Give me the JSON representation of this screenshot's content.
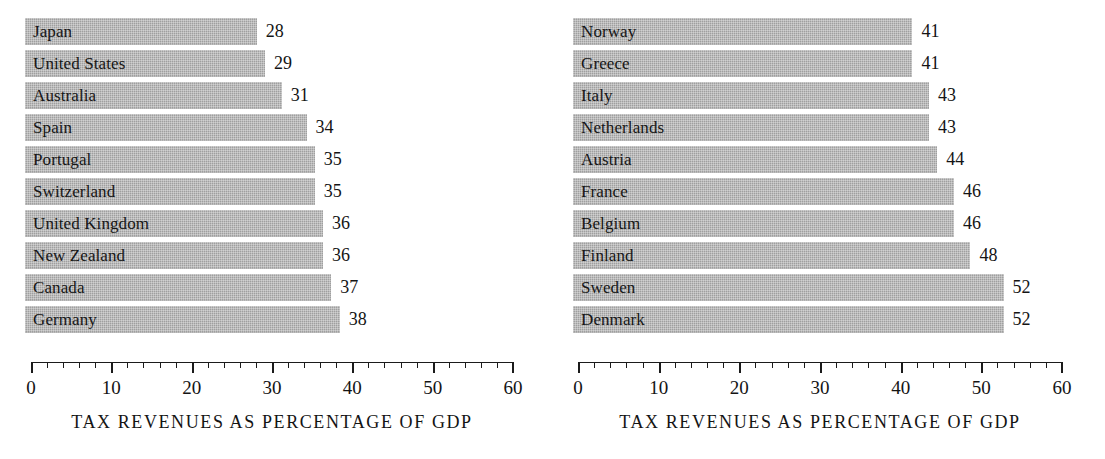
{
  "figure": {
    "background_color": "#ffffff",
    "bar_color": "#a9a9a9",
    "text_color": "#161616"
  },
  "axis": {
    "min": 0,
    "max": 60,
    "major_step": 10,
    "minor_step": 2,
    "tick_labels": [
      "0",
      "10",
      "20",
      "30",
      "40",
      "50",
      "60"
    ]
  },
  "charts": [
    {
      "id": "left",
      "caption": "TAX REVENUES AS PERCENTAGE OF GDP",
      "bars": [
        {
          "label": "Japan",
          "value": 28,
          "value_text": "28"
        },
        {
          "label": "United States",
          "value": 29,
          "value_text": "29"
        },
        {
          "label": "Australia",
          "value": 31,
          "value_text": "31"
        },
        {
          "label": "Spain",
          "value": 34,
          "value_text": "34"
        },
        {
          "label": "Portugal",
          "value": 35,
          "value_text": "35"
        },
        {
          "label": "Switzerland",
          "value": 35,
          "value_text": "35"
        },
        {
          "label": "United Kingdom",
          "value": 36,
          "value_text": "36"
        },
        {
          "label": "New Zealand",
          "value": 36,
          "value_text": "36"
        },
        {
          "label": "Canada",
          "value": 37,
          "value_text": "37"
        },
        {
          "label": "Germany",
          "value": 38,
          "value_text": "38"
        }
      ]
    },
    {
      "id": "right",
      "caption": "TAX REVENUES AS PERCENTAGE OF GDP",
      "bars": [
        {
          "label": "Norway",
          "value": 41,
          "value_text": "41"
        },
        {
          "label": "Greece",
          "value": 41,
          "value_text": "41"
        },
        {
          "label": "Italy",
          "value": 43,
          "value_text": "43"
        },
        {
          "label": "Netherlands",
          "value": 43,
          "value_text": "43"
        },
        {
          "label": "Austria",
          "value": 44,
          "value_text": "44"
        },
        {
          "label": "France",
          "value": 46,
          "value_text": "46"
        },
        {
          "label": "Belgium",
          "value": 46,
          "value_text": "46"
        },
        {
          "label": "Finland",
          "value": 48,
          "value_text": "48"
        },
        {
          "label": "Sweden",
          "value": 52,
          "value_text": "52"
        },
        {
          "label": "Denmark",
          "value": 52,
          "value_text": "52"
        }
      ]
    }
  ],
  "chart_data": [
    {
      "type": "bar",
      "orientation": "horizontal",
      "title": "",
      "xlabel": "TAX REVENUES AS PERCENTAGE OF GDP",
      "ylabel": "",
      "xlim": [
        0,
        60
      ],
      "grid": false,
      "legend": false,
      "categories": [
        "Japan",
        "United States",
        "Australia",
        "Spain",
        "Portugal",
        "Switzerland",
        "United Kingdom",
        "New Zealand",
        "Canada",
        "Germany"
      ],
      "values": [
        28,
        29,
        31,
        34,
        35,
        35,
        36,
        36,
        37,
        38
      ],
      "xticks": [
        0,
        10,
        20,
        30,
        40,
        50,
        60
      ],
      "minor_xticks": [
        2,
        4,
        6,
        8,
        12,
        14,
        16,
        18,
        22,
        24,
        26,
        28,
        32,
        34,
        36,
        38,
        42,
        44,
        46,
        48,
        52,
        54,
        56,
        58
      ],
      "data_labels": [
        "28",
        "29",
        "31",
        "34",
        "35",
        "35",
        "36",
        "36",
        "37",
        "38"
      ]
    },
    {
      "type": "bar",
      "orientation": "horizontal",
      "title": "",
      "xlabel": "TAX REVENUES AS PERCENTAGE OF GDP",
      "ylabel": "",
      "xlim": [
        0,
        60
      ],
      "grid": false,
      "legend": false,
      "categories": [
        "Norway",
        "Greece",
        "Italy",
        "Netherlands",
        "Austria",
        "France",
        "Belgium",
        "Finland",
        "Sweden",
        "Denmark"
      ],
      "values": [
        41,
        41,
        43,
        43,
        44,
        46,
        46,
        48,
        52,
        52
      ],
      "xticks": [
        0,
        10,
        20,
        30,
        40,
        50,
        60
      ],
      "minor_xticks": [
        2,
        4,
        6,
        8,
        12,
        14,
        16,
        18,
        22,
        24,
        26,
        28,
        32,
        34,
        36,
        38,
        42,
        44,
        46,
        48,
        52,
        54,
        56,
        58
      ],
      "data_labels": [
        "41",
        "41",
        "43",
        "43",
        "44",
        "46",
        "46",
        "48",
        "52",
        "52"
      ]
    }
  ]
}
